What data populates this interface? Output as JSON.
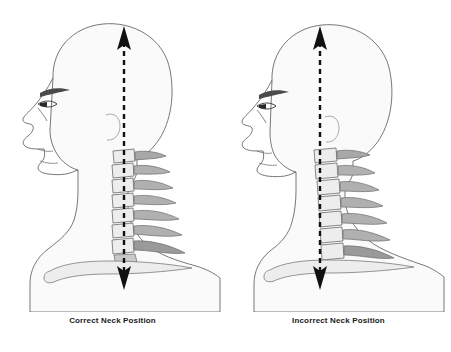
{
  "illustration": {
    "title": "Neck Position Comparison",
    "subject": "cervical spine alignment",
    "view": "lateral profile",
    "panel_count": 2
  },
  "panels": [
    {
      "id": "correct",
      "caption": "Correct Neck Position",
      "posture": "neutral aligned",
      "plumb_line_x": 124,
      "head_offset": 0,
      "spine_curve": "straight vertical",
      "description": "Head centered over shoulders, plumb line passes through ear and cervical vertebrae"
    },
    {
      "id": "incorrect",
      "caption": "Incorrect Neck Position",
      "posture": "forward head",
      "plumb_line_x": 320,
      "head_offset": 14,
      "spine_curve": "forward shifted",
      "description": "Head translated forward of shoulders, plumb line falls behind the cervical vertebrae"
    }
  ],
  "annotations": {
    "plumb_line_style": "dashed",
    "arrow_top": "up-arrowhead",
    "arrow_bottom": "down-arrowhead"
  },
  "anatomy": {
    "vertebrae_count": 7,
    "vertebrae_label": "cervical vertebrae",
    "clavicle_label": "clavicle",
    "skull_label": "skull profile",
    "face_label": "facial profile"
  },
  "colors": {
    "background": "#ffffff",
    "outline": "#4a4a4a",
    "skin_fill": "#fafafa",
    "bone_light": "#ededed",
    "bone_mid": "#c9c9c9",
    "bone_dark": "#9a9a9a",
    "line_black": "#111111",
    "caption_text": "#1a1a1a"
  }
}
